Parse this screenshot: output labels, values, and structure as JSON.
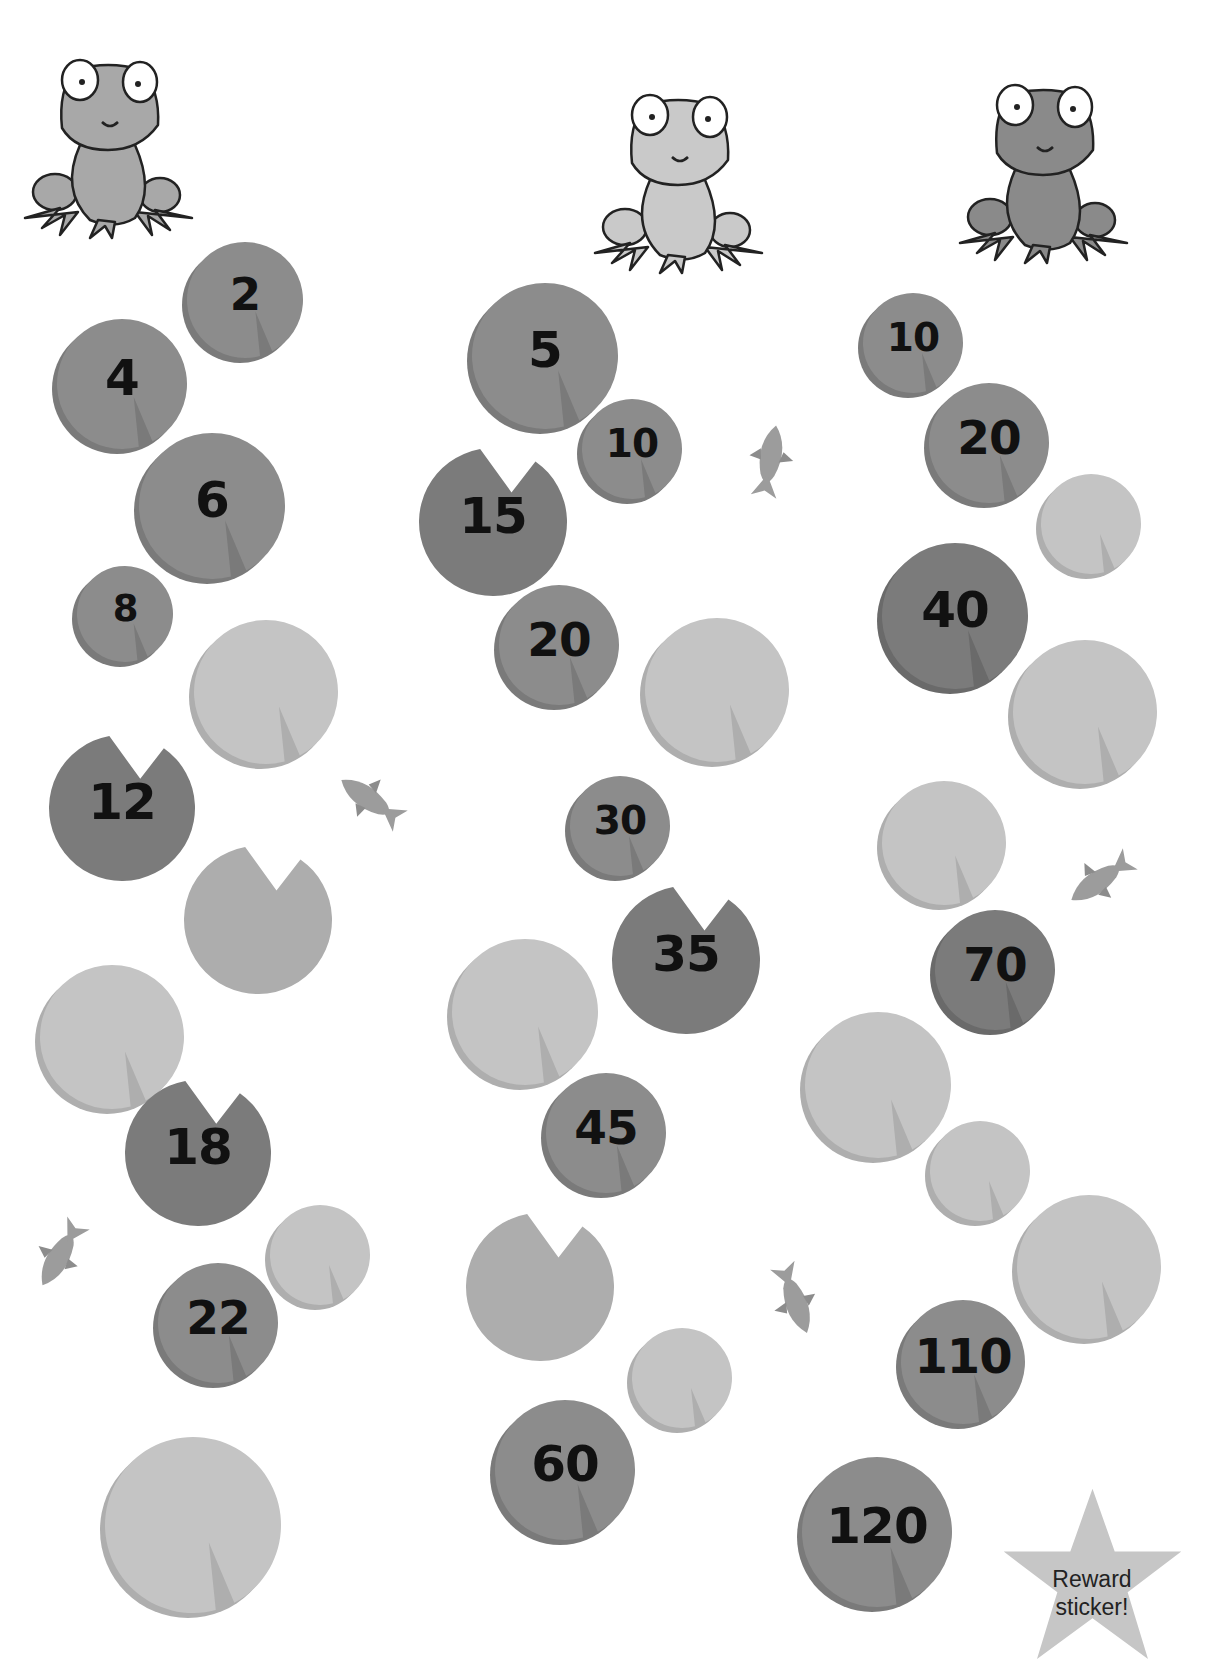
{
  "colors": {
    "pad_dark": "#7b7b7b",
    "pad_mid": "#8c8c8c",
    "pad_light": "#bdbdbd",
    "pad_empty": "#c4c4c4",
    "pad_shadow": "#9a9a9a",
    "fish": "#a3a3a3",
    "star": "#c6c6c6"
  },
  "frogs": [
    {
      "name": "frog-left",
      "tone": "mid",
      "x": 20,
      "y": 50
    },
    {
      "name": "frog-center",
      "tone": "light",
      "x": 590,
      "y": 85
    },
    {
      "name": "frog-right",
      "tone": "dark",
      "x": 955,
      "y": 75
    }
  ],
  "columns": [
    {
      "name": "count-by-2",
      "pads": [
        {
          "label": "2",
          "x": 245,
          "y": 300,
          "r": 58,
          "tone": "mid"
        },
        {
          "label": "4",
          "x": 122,
          "y": 384,
          "r": 65,
          "tone": "mid"
        },
        {
          "label": "6",
          "x": 212,
          "y": 506,
          "r": 73,
          "tone": "mid"
        },
        {
          "label": "8",
          "x": 125,
          "y": 614,
          "r": 48,
          "tone": "mid"
        },
        {
          "label": "",
          "x": 266,
          "y": 692,
          "r": 72,
          "tone": "empty"
        },
        {
          "label": "12",
          "x": 122,
          "y": 808,
          "r": 73,
          "tone": "dark",
          "cut": "top"
        },
        {
          "label": "",
          "x": 258,
          "y": 920,
          "r": 74,
          "tone": "mid-empty",
          "cut": "top"
        },
        {
          "label": "",
          "x": 112,
          "y": 1037,
          "r": 72,
          "tone": "empty"
        },
        {
          "label": "18",
          "x": 198,
          "y": 1153,
          "r": 73,
          "tone": "dark",
          "cut": "top"
        },
        {
          "label": "",
          "x": 320,
          "y": 1255,
          "r": 50,
          "tone": "empty"
        },
        {
          "label": "22",
          "x": 218,
          "y": 1323,
          "r": 60,
          "tone": "mid"
        },
        {
          "label": "",
          "x": 193,
          "y": 1525,
          "r": 88,
          "tone": "empty"
        }
      ]
    },
    {
      "name": "count-by-5",
      "pads": [
        {
          "label": "5",
          "x": 545,
          "y": 356,
          "r": 73,
          "tone": "mid"
        },
        {
          "label": "10",
          "x": 632,
          "y": 449,
          "r": 50,
          "tone": "mid"
        },
        {
          "label": "15",
          "x": 493,
          "y": 522,
          "r": 74,
          "tone": "dark",
          "cut": "top"
        },
        {
          "label": "20",
          "x": 559,
          "y": 645,
          "r": 60,
          "tone": "mid"
        },
        {
          "label": "",
          "x": 717,
          "y": 690,
          "r": 72,
          "tone": "empty"
        },
        {
          "label": "30",
          "x": 620,
          "y": 826,
          "r": 50,
          "tone": "mid"
        },
        {
          "label": "35",
          "x": 686,
          "y": 960,
          "r": 74,
          "tone": "dark",
          "cut": "top"
        },
        {
          "label": "",
          "x": 525,
          "y": 1012,
          "r": 73,
          "tone": "empty"
        },
        {
          "label": "45",
          "x": 606,
          "y": 1133,
          "r": 60,
          "tone": "mid"
        },
        {
          "label": "",
          "x": 540,
          "y": 1287,
          "r": 74,
          "tone": "mid-empty",
          "cut": "top"
        },
        {
          "label": "",
          "x": 682,
          "y": 1378,
          "r": 50,
          "tone": "empty"
        },
        {
          "label": "60",
          "x": 565,
          "y": 1470,
          "r": 70,
          "tone": "mid"
        }
      ]
    },
    {
      "name": "count-by-10",
      "pads": [
        {
          "label": "10",
          "x": 913,
          "y": 343,
          "r": 50,
          "tone": "mid"
        },
        {
          "label": "20",
          "x": 989,
          "y": 443,
          "r": 60,
          "tone": "mid"
        },
        {
          "label": "",
          "x": 1091,
          "y": 524,
          "r": 50,
          "tone": "empty"
        },
        {
          "label": "40",
          "x": 955,
          "y": 616,
          "r": 73,
          "tone": "dark"
        },
        {
          "label": "",
          "x": 1085,
          "y": 712,
          "r": 72,
          "tone": "empty"
        },
        {
          "label": "",
          "x": 944,
          "y": 843,
          "r": 62,
          "tone": "empty"
        },
        {
          "label": "70",
          "x": 995,
          "y": 970,
          "r": 60,
          "tone": "dark"
        },
        {
          "label": "",
          "x": 878,
          "y": 1085,
          "r": 73,
          "tone": "empty"
        },
        {
          "label": "",
          "x": 980,
          "y": 1171,
          "r": 50,
          "tone": "empty"
        },
        {
          "label": "",
          "x": 1089,
          "y": 1267,
          "r": 72,
          "tone": "empty"
        },
        {
          "label": "110",
          "x": 963,
          "y": 1362,
          "r": 62,
          "tone": "mid"
        },
        {
          "label": "120",
          "x": 877,
          "y": 1532,
          "r": 75,
          "tone": "mid"
        }
      ]
    }
  ],
  "fish": [
    {
      "name": "fish-1",
      "x": 770,
      "y": 460,
      "rot": 100
    },
    {
      "name": "fish-2",
      "x": 370,
      "y": 800,
      "rot": 35
    },
    {
      "name": "fish-3",
      "x": 1100,
      "y": 880,
      "rot": -35
    },
    {
      "name": "fish-4",
      "x": 60,
      "y": 1255,
      "rot": -60
    },
    {
      "name": "fish-5",
      "x": 795,
      "y": 1300,
      "rot": 250
    }
  ],
  "reward": {
    "line1": "Reward",
    "line2": "sticker!"
  }
}
